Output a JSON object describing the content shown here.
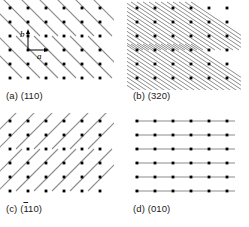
{
  "figure": {
    "type": "crystal-lattice-plane-diagram-grid",
    "background_color": "#ffffff",
    "point_color": "#000000",
    "line_color": "#8c8c8c",
    "annotation_color": "#1a1a1a"
  },
  "panels": [
    {
      "key": "a",
      "caption_prefix": "(a)",
      "miller_index": "(110)",
      "overbar_on": "none",
      "trace_direction": "down-right",
      "trace_count": 7,
      "point_cols": 7,
      "point_rows": 6,
      "has_unit_cell": true
    },
    {
      "key": "b",
      "caption_prefix": "(b)",
      "miller_index": "(320)",
      "overbar_on": "none",
      "trace_direction": "down-right-shallow",
      "trace_count": 22,
      "point_cols": 7,
      "point_rows": 6,
      "has_unit_cell": false
    },
    {
      "key": "c",
      "caption_prefix": "(c)",
      "miller_index": "(110)",
      "overbar_on": "first-1",
      "trace_direction": "up-right",
      "trace_count": 7,
      "point_cols": 7,
      "point_rows": 6,
      "has_unit_cell": false
    },
    {
      "key": "d",
      "caption_prefix": "(d)",
      "miller_index": "(010)",
      "overbar_on": "none",
      "trace_direction": "horizontal",
      "trace_count": 6,
      "point_cols": 7,
      "point_rows": 6,
      "has_unit_cell": false
    }
  ],
  "unit_cell": {
    "vector_a_label": "a",
    "vector_b_label": "b",
    "vector_a_orientation": "horizontal-right",
    "vector_b_orientation": "vertical-up"
  },
  "captions": {
    "a": "(a) (110)",
    "b": "(b) (320)",
    "c": "(c) (110)",
    "d": "(d) (010)"
  }
}
